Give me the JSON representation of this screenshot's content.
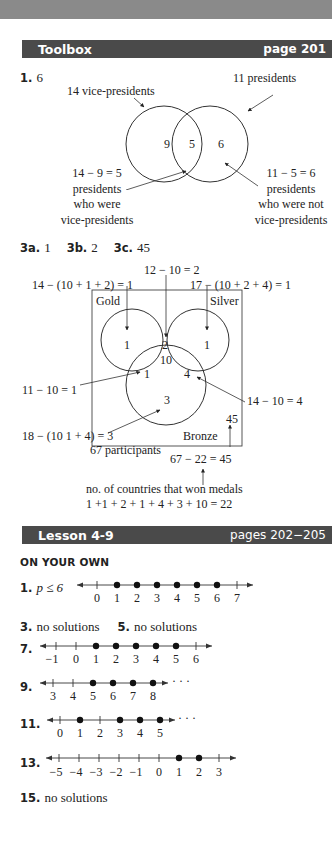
{
  "sections": {
    "toolbox": {
      "title": "Toolbox",
      "page": "page 201",
      "problem1": {
        "number": "1.",
        "answer": "6",
        "labels": {
          "vp_total": "14 vice-presidents",
          "p_total": "11 presidents",
          "left_region": "9",
          "middle_region": "5",
          "right_region": "6",
          "left_calc": "14 − 9 = 5",
          "left_desc_1": "presidents",
          "left_desc_2": "who were",
          "left_desc_3": "vice-presidents",
          "right_calc": "11 − 5 = 6",
          "right_desc_1": "presidents",
          "right_desc_2": "who were not",
          "right_desc_3": "vice-presidents"
        }
      },
      "problem3": {
        "a_num": "3a.",
        "a_ans": "1",
        "b_num": "3b.",
        "b_ans": "2",
        "c_num": "3c.",
        "c_ans": "45",
        "labels": {
          "gold_silver_calc": "12 − 10 = 2",
          "gold_only_calc": "14 − (10 + 1 + 2) = 1",
          "silver_only_calc": "17 − (10 + 2 + 4) = 1",
          "gold": "Gold",
          "silver": "Silver",
          "bronze": "Bronze",
          "gold_only": "1",
          "gold_silver": "2",
          "silver_only": "1",
          "all_three": "10",
          "gold_bronze": "1",
          "silver_bronze": "4",
          "bronze_only": "3",
          "gold_bronze_calc": "11 − 10 = 1",
          "silver_bronze_calc": "14 − 10 = 4",
          "bronze_only_calc": "18 − (10  1 + 4) = 3",
          "outside": "45",
          "participants": "67 participants",
          "outside_calc": "67 − 22 = 45",
          "won_medals": "no. of countries that won medals",
          "won_sum": "1 +1 + 2 + 1 + 4 + 3 + 10 = 22"
        }
      }
    },
    "lesson": {
      "title": "Lesson 4-9",
      "pages": "pages 202−205",
      "subheading": "ON YOUR OWN",
      "items": [
        {
          "number": "1.",
          "answer": "p ≤ 6",
          "ticks": [
            "0",
            "1",
            "2",
            "3",
            "4",
            "5",
            "6",
            "7"
          ],
          "dots": [
            "1",
            "2",
            "3",
            "4",
            "5",
            "6"
          ],
          "ellipsis": ""
        },
        {
          "number": "3.",
          "answer": "no solutions"
        },
        {
          "number": "5.",
          "answer": "no solutions"
        },
        {
          "number": "7.",
          "ticks": [
            "−1",
            "0",
            "1",
            "2",
            "3",
            "4",
            "5",
            "6"
          ],
          "dots": [
            "1",
            "2",
            "3",
            "4",
            "5"
          ],
          "ellipsis": ""
        },
        {
          "number": "9.",
          "ticks": [
            "3",
            "4",
            "5",
            "6",
            "7",
            "8"
          ],
          "dots": [
            "5",
            "6",
            "7",
            "8"
          ],
          "ellipsis": "· · ·"
        },
        {
          "number": "11.",
          "ticks": [
            "0",
            "1",
            "2",
            "3",
            "4",
            "5"
          ],
          "dots": [
            "1",
            "3",
            "4",
            "5"
          ],
          "ellipsis": "· · ·"
        },
        {
          "number": "13.",
          "ticks": [
            "−5",
            "−4",
            "−3",
            "−2",
            "−1",
            "0",
            "1",
            "2",
            "3"
          ],
          "dots": [
            "1",
            "2"
          ],
          "ellipsis": ""
        },
        {
          "number": "15.",
          "answer": "no solutions"
        }
      ]
    }
  }
}
